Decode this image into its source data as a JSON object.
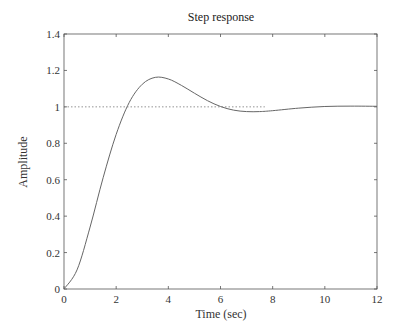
{
  "chart_data": {
    "type": "line",
    "title": "Step response",
    "xlabel": "Time (sec)",
    "ylabel": "Amplitude",
    "xlim": [
      0,
      12
    ],
    "ylim": [
      0,
      1.4
    ],
    "xticks": [
      "0",
      "2",
      "4",
      "6",
      "8",
      "10",
      "12"
    ],
    "yticks": [
      "0",
      "0.2",
      "0.4",
      "0.6",
      "0.8",
      "1",
      "1.2",
      "1.4"
    ],
    "grid": false,
    "legend": null,
    "series": [
      {
        "name": "step response",
        "style": "solid",
        "x": [
          0,
          0.5,
          1,
          1.5,
          2,
          2.5,
          3,
          3.5,
          4,
          4.5,
          5,
          5.5,
          6,
          6.5,
          7,
          7.5,
          8,
          9,
          10,
          11,
          12
        ],
        "y": [
          0,
          0.105,
          0.34,
          0.611,
          0.849,
          1.024,
          1.124,
          1.162,
          1.153,
          1.118,
          1.075,
          1.034,
          1.002,
          0.982,
          0.974,
          0.974,
          0.979,
          0.993,
          1.002,
          1.004,
          1.003
        ]
      },
      {
        "name": "reference (final value)",
        "style": "dotted",
        "x": [
          0,
          7.7
        ],
        "y": [
          1,
          1
        ]
      }
    ],
    "annotations": []
  }
}
